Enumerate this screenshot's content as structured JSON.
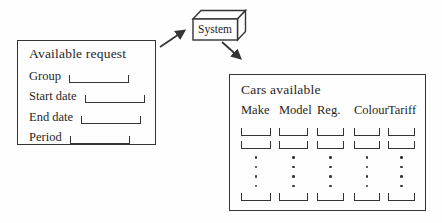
{
  "colors": {
    "ink": "#343434",
    "background": "#fefefe"
  },
  "system_node": {
    "label": "System"
  },
  "request_form": {
    "title": "Available request",
    "fields": [
      {
        "label": "Group"
      },
      {
        "label": "Start date"
      },
      {
        "label": "End date"
      },
      {
        "label": "Period"
      }
    ]
  },
  "results_table": {
    "title": "Cars available",
    "columns": [
      {
        "label": "Make"
      },
      {
        "label": "Model"
      },
      {
        "label": "Reg."
      },
      {
        "label": "Colour"
      },
      {
        "label": "Tariff"
      }
    ],
    "empty_cell_rows_top": 2,
    "empty_cell_rows_bottom": 1,
    "ellipsis_dots_per_column": 4
  },
  "arrows": [
    {
      "name": "request-to-system"
    },
    {
      "name": "system-to-results"
    }
  ]
}
